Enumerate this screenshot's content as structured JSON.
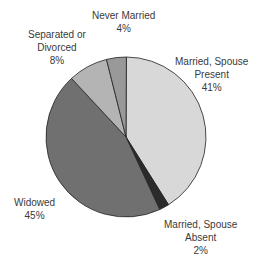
{
  "chart_data": {
    "type": "pie",
    "title": "",
    "slices": [
      {
        "label": "Married, Spouse Present",
        "value": 41,
        "color": "#d8d8d8"
      },
      {
        "label": "Married, Spouse Absent",
        "value": 2,
        "color": "#2b2b2b"
      },
      {
        "label": "Widowed",
        "value": 45,
        "color": "#707070"
      },
      {
        "label": "Separated or Divorced",
        "value": 8,
        "color": "#b4b4b4"
      },
      {
        "label": "Never Married",
        "value": 4,
        "color": "#999999"
      }
    ]
  },
  "labels": {
    "present": {
      "l1": "Married, Spouse",
      "l2": "Present",
      "pct": "41%"
    },
    "absent": {
      "l1": "Married, Spouse",
      "l2": "Absent",
      "pct": "2%"
    },
    "widowed": {
      "l1": "Widowed",
      "pct": "45%"
    },
    "separated": {
      "l1": "Separated or",
      "l2": "Divorced",
      "pct": "8%"
    },
    "never": {
      "l1": "Never Married",
      "pct": "4%"
    }
  }
}
